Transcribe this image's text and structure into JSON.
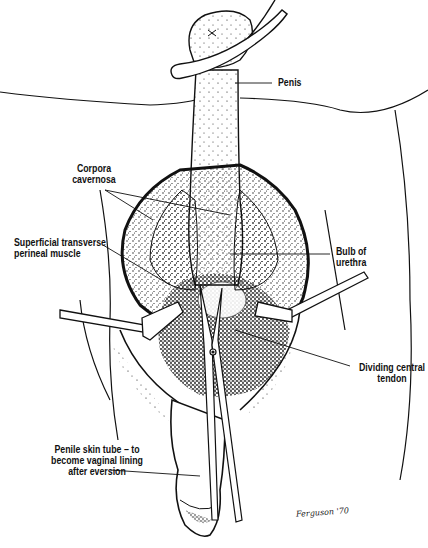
{
  "figure": {
    "type": "surgical line illustration",
    "background": "#ffffff",
    "ink_color": "#111111",
    "labels": [
      {
        "id": "penis",
        "text": "Penis"
      },
      {
        "id": "corpora_cavernosa",
        "text": "Corpora\ncavernosa"
      },
      {
        "id": "superficial_transverse_perineal_muscle",
        "text": "Superficial transverse\nperineal muscle"
      },
      {
        "id": "bulb_of_urethra",
        "text": "Bulb of\nurethra"
      },
      {
        "id": "dividing_central_tendon",
        "text": "Dividing central\ntendon"
      },
      {
        "id": "penile_skin_tube",
        "text": "Penile skin tube – to\nbecome vaginal lining\nafter eversion"
      }
    ],
    "signature": "Ferguson '70",
    "instruments": [
      "retractor-left",
      "retractor-right",
      "scissors"
    ]
  }
}
